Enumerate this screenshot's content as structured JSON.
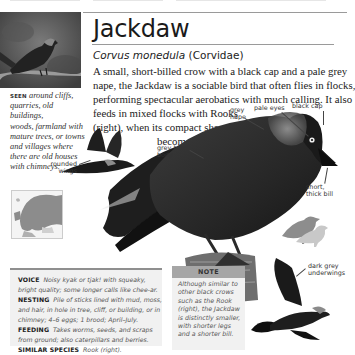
{
  "page": {
    "title": "Jackdaw",
    "scientific_name": "Corvus monedula",
    "family": "(Corvidae)",
    "description_lines": [
      "A small, short-billed crow with a black cap and a pale grey",
      "nape, the Jackdaw is a sociable bird that often flies in flocks,",
      "performing spectacular aerobatics with much calling. It also",
      "feeds in mixed flocks with Rooks",
      "(right), when its compact shape",
      "becomes obvious."
    ]
  },
  "seen": {
    "label": "SEEN",
    "lines": [
      "around cliffs,",
      "quarries, old buildings,",
      "woods, farmland with",
      "mature trees, or towns",
      "and villages where",
      "there are old houses",
      "with chimneys."
    ]
  },
  "annotations": {
    "rounded_wings": [
      "rounded",
      "wings"
    ],
    "grey_nape": [
      "grey",
      "nape"
    ],
    "pale_eyes": "pale eyes",
    "black_cap": "black cap",
    "grey_black_body": [
      "grey-black",
      "body"
    ],
    "short_thick_bill": [
      "short,",
      "thick bill"
    ],
    "dark_grey_underwings": [
      "dark grey",
      "underwings"
    ]
  },
  "info_box": {
    "rows": [
      {
        "label": "VOICE",
        "text": "Noisy kyak or tjak! with squeaky,"
      },
      {
        "label": "",
        "text": "bright quality; some longer calls like chee-ar."
      },
      {
        "label": "NESTING",
        "text": "Pile of sticks lined with mud, moss,"
      },
      {
        "label": "",
        "text": "and hair, in hole in tree, cliff, or building, or in"
      },
      {
        "label": "",
        "text": "chimney; 4–6 eggs; 1 brood; April–July."
      },
      {
        "label": "FEEDING",
        "text": "Takes worms, seeds, and scraps"
      },
      {
        "label": "",
        "text": "from ground; also caterpillars and berries."
      },
      {
        "label": "SIMILAR SPECIES",
        "text": "Rook (right)."
      }
    ]
  },
  "note": {
    "heading": "NOTE",
    "lines": [
      "Although similar to",
      "other black crows",
      "such as the Rook",
      "(right), the Jackdaw",
      "is distinctly smaller,",
      "with shorter legs",
      "and a shorter bill."
    ]
  },
  "colors": {
    "rule": "#9a9a9a",
    "box_bg": "#f1f1f1",
    "note_header": "#a6a6a6",
    "rook_silhouette": "#8d8d8d",
    "jackdaw_silhouette": "#c8c8c8"
  }
}
